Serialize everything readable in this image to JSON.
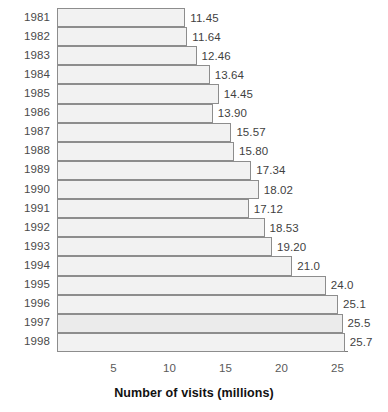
{
  "chart_data": {
    "type": "bar",
    "orientation": "horizontal",
    "title": "",
    "xlabel": "Number of visits (millions)",
    "ylabel": "",
    "xlim": [
      0,
      26.5
    ],
    "xticks": [
      5,
      10,
      15,
      20,
      25
    ],
    "grid": false,
    "legend": null,
    "categories": [
      "1981",
      "1982",
      "1983",
      "1984",
      "1985",
      "1986",
      "1987",
      "1988",
      "1989",
      "1990",
      "1991",
      "1992",
      "1993",
      "1994",
      "1995",
      "1996",
      "1997",
      "1998"
    ],
    "values": [
      11.45,
      11.64,
      12.46,
      13.64,
      14.45,
      13.9,
      15.57,
      15.8,
      17.34,
      18.02,
      17.12,
      18.53,
      19.2,
      21.0,
      24.0,
      25.1,
      25.5,
      25.7
    ],
    "data_labels": [
      "11.45",
      "11.64",
      "12.46",
      "13.64",
      "14.45",
      "13.90",
      "15.57",
      "15.80",
      "17.34",
      "18.02",
      "17.12",
      "18.53",
      "19.20",
      "21.0",
      "24.0",
      "25.1",
      "25.5",
      "25.7"
    ],
    "bar_fill_color": "#f2f2f2",
    "bar_border_color": "#8d8d8d",
    "axis_color": "#7a7a7a",
    "text_color": "#4a4a4a"
  },
  "axis": {
    "x_title": "Number of visits (millions)",
    "tick_labels": [
      "5",
      "10",
      "15",
      "20",
      "25"
    ]
  }
}
